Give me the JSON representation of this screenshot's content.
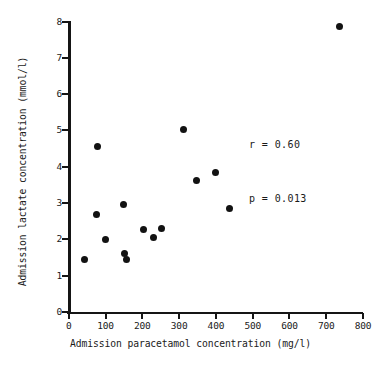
{
  "chart_data": {
    "type": "scatter",
    "title": "",
    "xlabel": "Admission paracetamol concentration (mg/l)",
    "ylabel": "Admission lactate concentration (mmol/l)",
    "xlim": [
      0,
      800
    ],
    "ylim": [
      0,
      8
    ],
    "xticks": [
      0,
      100,
      200,
      300,
      400,
      500,
      600,
      700,
      800
    ],
    "xtick_labels": [
      "0",
      "100",
      "200",
      "300",
      "400",
      "500",
      "600",
      "700",
      "800"
    ],
    "yticks": [
      0,
      1,
      2,
      3,
      4,
      5,
      6,
      7,
      8
    ],
    "ytick_labels": [
      "0",
      "1",
      "2",
      "3",
      "4",
      "5",
      "6",
      "7",
      "8"
    ],
    "grid": false,
    "legend": null,
    "marker": "filled-circle",
    "marker_color": "#121212",
    "points": [
      {
        "x": 44,
        "y": 1.45
      },
      {
        "x": 78,
        "y": 4.55
      },
      {
        "x": 76,
        "y": 2.68
      },
      {
        "x": 100,
        "y": 2.0
      },
      {
        "x": 150,
        "y": 2.95
      },
      {
        "x": 152,
        "y": 1.6
      },
      {
        "x": 158,
        "y": 1.45
      },
      {
        "x": 203,
        "y": 2.27
      },
      {
        "x": 231,
        "y": 2.06
      },
      {
        "x": 253,
        "y": 2.3
      },
      {
        "x": 312,
        "y": 5.03
      },
      {
        "x": 347,
        "y": 3.62
      },
      {
        "x": 400,
        "y": 3.83
      },
      {
        "x": 437,
        "y": 2.86
      },
      {
        "x": 735,
        "y": 7.87
      }
    ],
    "annotations": [
      {
        "text": "r = 0.60",
        "x": 560,
        "y": 5.9
      },
      {
        "text": "p = 0.013",
        "x": 560,
        "y": 5.4
      }
    ]
  },
  "stats": {
    "r_line": "r = 0.60",
    "p_line": "p = 0.013"
  },
  "axes": {
    "x_title": "Admission paracetamol concentration (mg/l)",
    "y_title": "Admission lactate concentration (mmol/l)"
  }
}
